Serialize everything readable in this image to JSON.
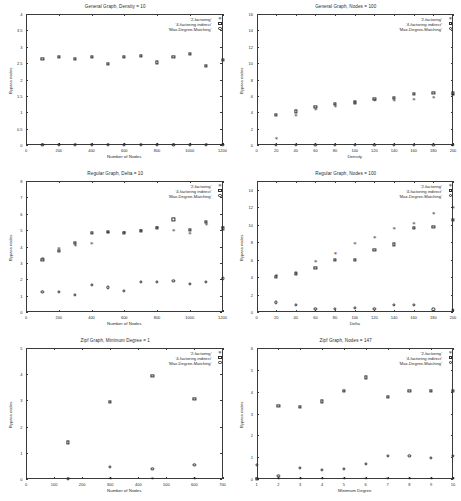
{
  "figure": {
    "series_names": [
      "'2-factoring'",
      "'4-factoring indirect'",
      "'Max-Degree-Matching'"
    ],
    "ylabel": "Bypass nodes"
  },
  "chart_data": [
    {
      "type": "scatter",
      "title": "General Graph, Density = 10",
      "xlabel": "Number of Nodes",
      "ylabel": "Bypass nodes",
      "xlim": [
        0,
        1200
      ],
      "ylim": [
        0,
        4
      ],
      "xticks": [
        0,
        200,
        400,
        600,
        800,
        1000,
        1200
      ],
      "yticks": [
        0,
        0.5,
        1,
        1.5,
        2,
        2.5,
        3,
        3.5,
        4
      ],
      "grid": false,
      "legend_position": "top-right",
      "x": [
        100,
        200,
        300,
        400,
        500,
        600,
        700,
        800,
        900,
        1000,
        1100,
        1200
      ],
      "series": [
        {
          "name": "'2-factoring'",
          "marker": "star-filled",
          "values": [
            0,
            0,
            0,
            0,
            0,
            0,
            0,
            0,
            0,
            0,
            0,
            0
          ]
        },
        {
          "name": "'4-factoring indirect'",
          "marker": "square-open",
          "values": [
            2.62,
            2.7,
            2.63,
            2.7,
            2.48,
            2.68,
            2.72,
            2.52,
            2.68,
            2.78,
            2.42,
            2.6
          ]
        },
        {
          "name": "'Max-Degree-Matching'",
          "marker": "circle-open",
          "values": [
            0,
            0,
            0,
            0,
            0,
            0,
            0,
            0,
            0,
            0,
            0,
            0
          ]
        }
      ]
    },
    {
      "type": "scatter",
      "title": "General Graph, Nodes = 100",
      "xlabel": "Density",
      "ylabel": "Bypass nodes",
      "xlim": [
        0,
        200
      ],
      "ylim": [
        0,
        16
      ],
      "xticks": [
        0,
        20,
        40,
        60,
        80,
        100,
        120,
        140,
        160,
        180,
        200
      ],
      "yticks": [
        0,
        2,
        4,
        6,
        8,
        10,
        12,
        14,
        16
      ],
      "grid": false,
      "legend_position": "top-right",
      "x": [
        20,
        40,
        60,
        80,
        100,
        120,
        140,
        160,
        180,
        200
      ],
      "series": [
        {
          "name": "'2-factoring'",
          "marker": "star-filled",
          "values": [
            0.7,
            3.5,
            4.3,
            4.6,
            5.1,
            5.4,
            5.4,
            5.5,
            5.8,
            6.1
          ]
        },
        {
          "name": "'4-factoring indirect'",
          "marker": "square-open",
          "values": [
            3.7,
            4.1,
            4.7,
            5.0,
            5.2,
            5.6,
            5.8,
            6.2,
            6.4,
            6.3
          ]
        },
        {
          "name": "'Max-Degree-Matching'",
          "marker": "circle-open",
          "values": [
            0,
            0,
            0,
            0,
            0,
            0,
            0,
            0,
            0,
            0
          ]
        }
      ]
    },
    {
      "type": "scatter",
      "title": "Regular Graph, Delta = 10",
      "xlabel": "Number of Nodes",
      "ylabel": "Bypass nodes",
      "xlim": [
        0,
        1200
      ],
      "ylim": [
        0,
        8
      ],
      "xticks": [
        0,
        200,
        400,
        600,
        800,
        1000,
        1200
      ],
      "yticks": [
        0,
        1,
        2,
        3,
        4,
        5,
        6,
        7,
        8
      ],
      "grid": false,
      "legend_position": "top-right",
      "x": [
        100,
        200,
        300,
        400,
        500,
        600,
        700,
        800,
        900,
        1000,
        1100,
        1200
      ],
      "series": [
        {
          "name": "'2-factoring'",
          "marker": "star-filled",
          "values": [
            3.25,
            3.85,
            4.05,
            4.15,
            4.85,
            4.8,
            4.95,
            5.15,
            4.95,
            4.75,
            5.3,
            5.1
          ]
        },
        {
          "name": "'4-factoring indirect'",
          "marker": "square-open",
          "values": [
            3.2,
            3.75,
            4.2,
            4.85,
            4.9,
            4.85,
            4.95,
            5.15,
            5.65,
            5.0,
            5.5,
            5.1
          ]
        },
        {
          "name": "'Max-Degree-Matching'",
          "marker": "circle-open",
          "values": [
            1.25,
            1.25,
            1.05,
            1.65,
            1.5,
            1.3,
            1.85,
            1.85,
            1.9,
            1.7,
            1.85,
            2.05
          ]
        }
      ]
    },
    {
      "type": "scatter",
      "title": "Regular Graph, Nodes = 100",
      "xlabel": "Delta",
      "ylabel": "Bypass nodes",
      "xlim": [
        0,
        200
      ],
      "ylim": [
        0,
        15
      ],
      "xticks": [
        0,
        20,
        40,
        60,
        80,
        100,
        120,
        140,
        160,
        180,
        200
      ],
      "yticks": [
        0,
        2,
        4,
        6,
        8,
        10,
        12,
        14
      ],
      "grid": false,
      "legend_position": "top-right",
      "x": [
        20,
        40,
        60,
        80,
        100,
        120,
        140,
        160,
        180,
        200
      ],
      "series": [
        {
          "name": "'2-factoring'",
          "marker": "star-filled",
          "values": [
            4.1,
            4.45,
            5.75,
            6.65,
            7.8,
            8.45,
            9.5,
            10.1,
            11.2,
            11.9
          ]
        },
        {
          "name": "'4-factoring indirect'",
          "marker": "square-open",
          "values": [
            4.0,
            4.35,
            5.05,
            5.95,
            5.95,
            7.1,
            7.75,
            9.6,
            9.75,
            10.5
          ]
        },
        {
          "name": "'Max-Degree-Matching'",
          "marker": "circle-open",
          "values": [
            1.1,
            0.85,
            0.4,
            0.35,
            0.45,
            0.35,
            0.85,
            0.8,
            0.3,
            0.25
          ]
        }
      ]
    },
    {
      "type": "scatter",
      "title": "Zipf Graph, Minimum Degree = 1",
      "xlabel": "Number of Nodes",
      "ylabel": "Bypass nodes",
      "xlim": [
        0,
        700
      ],
      "ylim": [
        0,
        5
      ],
      "xticks": [
        0,
        100,
        200,
        300,
        400,
        500,
        600,
        700
      ],
      "yticks": [
        0,
        1,
        2,
        3,
        4,
        5
      ],
      "grid": false,
      "legend_position": "top-right",
      "x": [
        150,
        300,
        450,
        600
      ],
      "series": [
        {
          "name": "'2-factoring'",
          "marker": "star-filled",
          "values": [
            0,
            0,
            0,
            0
          ]
        },
        {
          "name": "'4-factoring indirect'",
          "marker": "square-open",
          "values": [
            1.4,
            2.95,
            3.95,
            3.05
          ]
        },
        {
          "name": "'Max-Degree-Matching'",
          "marker": "circle-open",
          "values": [
            0,
            0.45,
            0.4,
            0.55
          ]
        }
      ]
    },
    {
      "type": "scatter",
      "title": "Zipf Graph, Nodes = 147",
      "xlabel": "Minimum Degree",
      "ylabel": "Bypass nodes",
      "xlim": [
        1,
        10
      ],
      "ylim": [
        0,
        6
      ],
      "xticks": [
        1,
        2,
        3,
        4,
        5,
        6,
        7,
        8,
        9,
        10
      ],
      "yticks": [
        0,
        1,
        2,
        3,
        4,
        5,
        6
      ],
      "grid": false,
      "legend_position": "top-right",
      "x": [
        1,
        2,
        3,
        4,
        5,
        6,
        7,
        8,
        9,
        10
      ],
      "series": [
        {
          "name": "'2-factoring'",
          "marker": "star-filled",
          "values": [
            0,
            0,
            0,
            0,
            0,
            0,
            0,
            0,
            0,
            0
          ]
        },
        {
          "name": "'4-factoring indirect'",
          "marker": "square-open",
          "values": [
            0,
            3.35,
            3.3,
            3.55,
            4.05,
            4.65,
            3.75,
            4.05,
            4.05,
            4.05
          ]
        },
        {
          "name": "'Max-Degree-Matching'",
          "marker": "circle-open",
          "values": [
            0.65,
            0.15,
            0.5,
            0.4,
            0.45,
            0.7,
            1.05,
            1.05,
            0.95,
            1.05
          ]
        }
      ]
    }
  ]
}
